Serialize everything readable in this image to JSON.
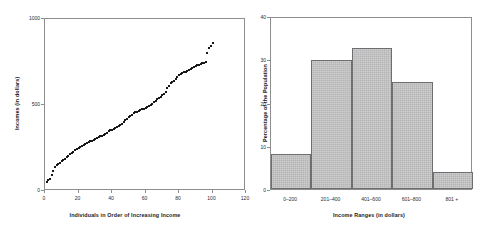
{
  "figure": {
    "background": "#ffffff",
    "marker_color": "#17171c",
    "bar_fill": "#c2c2c2",
    "bar_stroke": "#6e6e72",
    "axis_color": "#8e8e8e"
  },
  "panels": {
    "left": {
      "name": "income-scatter-panel",
      "xlabel": "Individuals in Order of Increasing Income",
      "ylabel": "Incomes (in dollars)",
      "xticks": [
        "0",
        "20",
        "40",
        "60",
        "80",
        "100",
        "120"
      ],
      "yticks": [
        "0",
        "500",
        "1000"
      ]
    },
    "right": {
      "name": "income-histogram-panel",
      "xlabel": "Income Ranges (in dollars)",
      "ylabel": "Percentage of the Population",
      "xticks": [
        "0–200",
        "201–400",
        "401–600",
        "601–800",
        "801 +"
      ],
      "yticks": [
        "0",
        "10",
        "20",
        "30",
        "40"
      ]
    }
  },
  "chart_data": [
    {
      "type": "scatter",
      "title": "",
      "xlabel": "Individuals in Order of Increasing Income",
      "ylabel": "Incomes (in dollars)",
      "xlim": [
        0,
        120
      ],
      "ylim": [
        0,
        1000
      ],
      "xticks": [
        0,
        20,
        40,
        60,
        80,
        100,
        120
      ],
      "yticks": [
        0,
        500,
        1000
      ],
      "grid": false,
      "legend": "none",
      "marker": "small filled square",
      "x": [
        1,
        2,
        3,
        4,
        5,
        6,
        7,
        8,
        9,
        10,
        11,
        12,
        13,
        14,
        15,
        16,
        17,
        18,
        19,
        20,
        21,
        22,
        23,
        24,
        25,
        26,
        27,
        28,
        29,
        30,
        31,
        32,
        33,
        34,
        35,
        36,
        37,
        38,
        39,
        40,
        41,
        42,
        43,
        44,
        45,
        46,
        47,
        48,
        49,
        50,
        51,
        52,
        53,
        54,
        55,
        56,
        57,
        58,
        59,
        60,
        61,
        62,
        63,
        64,
        65,
        66,
        67,
        68,
        69,
        70,
        71,
        72,
        73,
        74,
        75,
        76,
        77,
        78,
        79,
        80,
        81,
        82,
        83,
        84,
        85,
        86,
        87,
        88,
        89,
        90,
        91,
        92,
        93,
        94,
        95,
        96,
        97,
        98,
        99,
        100
      ],
      "y": [
        55,
        62,
        70,
        95,
        118,
        140,
        150,
        158,
        165,
        172,
        180,
        188,
        196,
        205,
        215,
        222,
        228,
        236,
        244,
        250,
        256,
        262,
        266,
        272,
        278,
        284,
        288,
        292,
        296,
        300,
        306,
        312,
        318,
        322,
        328,
        334,
        340,
        346,
        352,
        356,
        362,
        368,
        374,
        380,
        386,
        392,
        400,
        410,
        420,
        428,
        436,
        444,
        452,
        458,
        462,
        466,
        470,
        474,
        478,
        482,
        486,
        492,
        500,
        508,
        516,
        524,
        532,
        540,
        548,
        556,
        562,
        578,
        596,
        612,
        626,
        634,
        642,
        652,
        662,
        672,
        678,
        684,
        690,
        694,
        700,
        706,
        712,
        716,
        720,
        726,
        730,
        734,
        738,
        742,
        746,
        750,
        800,
        830,
        845,
        862
      ]
    },
    {
      "type": "bar",
      "title": "",
      "xlabel": "Income Ranges (in dollars)",
      "ylabel": "Percentage of the Population",
      "categories": [
        "0–200",
        "201–400",
        "401–600",
        "601–800",
        "801 +"
      ],
      "values": [
        8,
        29.8,
        32.7,
        24.7,
        4
      ],
      "ylim": [
        0,
        40
      ],
      "yticks": [
        0,
        10,
        20,
        30,
        40
      ],
      "grid": false,
      "legend": "none",
      "bar_gap": 0
    }
  ]
}
